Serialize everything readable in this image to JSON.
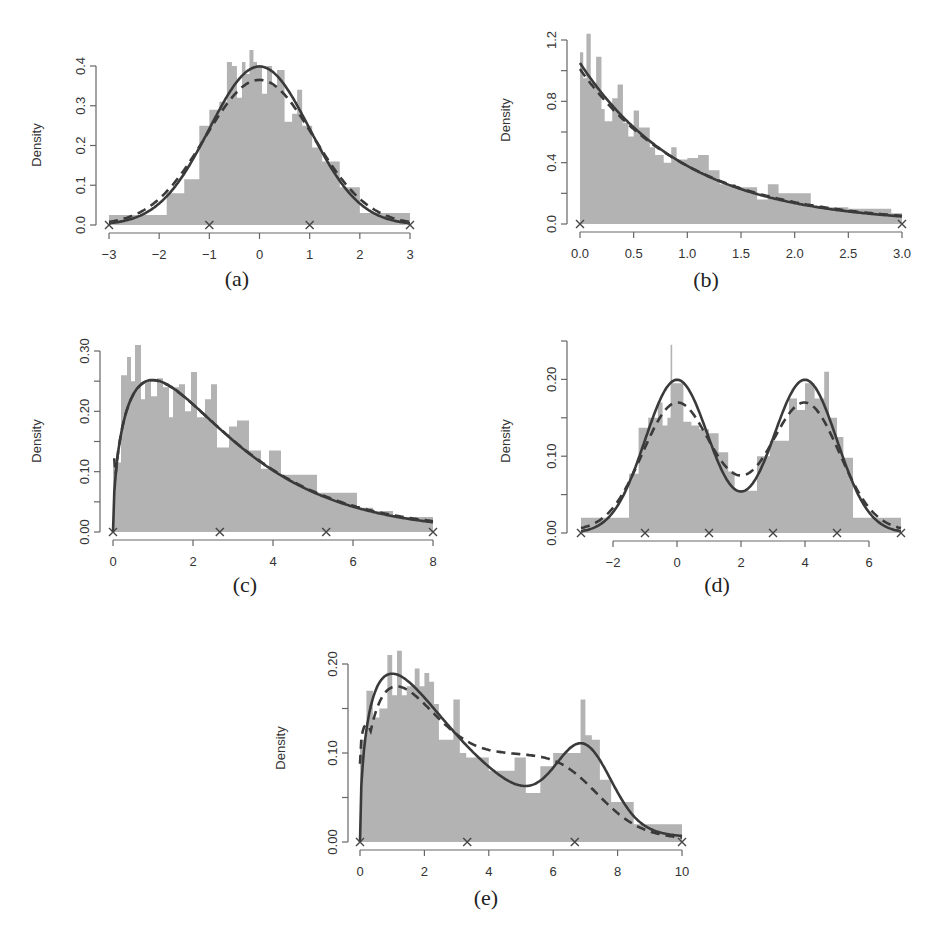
{
  "figure": {
    "panels": [
      "a",
      "b",
      "c",
      "d",
      "e"
    ]
  },
  "chart_data": [
    {
      "id": "a",
      "type": "bar",
      "caption": "(a)",
      "ylabel": "Density",
      "xlabel": "",
      "xlim": [
        -3,
        3
      ],
      "ylim": [
        0,
        0.4
      ],
      "xticks": [
        -3,
        -2,
        -1,
        0,
        1,
        2,
        3
      ],
      "xtick_labels": [
        "−3",
        "−2",
        "−1",
        "0",
        "1",
        "2",
        "3"
      ],
      "yticks": [
        0.0,
        0.1,
        0.2,
        0.3,
        0.4
      ],
      "ytick_labels": [
        "0.0",
        "0.1",
        "0.2",
        "0.3",
        "0.4"
      ],
      "true_density": {
        "family": "normal",
        "mean": 0,
        "sd": 1,
        "peak": 0.4
      },
      "estimated_density": {
        "description": "dashed, slightly flatter normal-like",
        "peak": 0.365
      },
      "knot_markers": [
        -3,
        -1,
        1,
        3
      ],
      "histogram": {
        "edges": [
          -3,
          -2.2,
          -1.85,
          -1.5,
          -1.2,
          -1.0,
          -0.8,
          -0.65,
          -0.55,
          -0.45,
          -0.35,
          -0.28,
          -0.2,
          -0.12,
          -0.05,
          0.05,
          0.15,
          0.25,
          0.35,
          0.5,
          0.65,
          0.75,
          0.85,
          1.05,
          1.25,
          1.6,
          2.0,
          3.0
        ],
        "heights": [
          0.025,
          0.025,
          0.08,
          0.115,
          0.25,
          0.29,
          0.31,
          0.41,
          0.4,
          0.32,
          0.41,
          0.38,
          0.44,
          0.41,
          0.4,
          0.33,
          0.4,
          0.35,
          0.39,
          0.26,
          0.28,
          0.34,
          0.25,
          0.195,
          0.16,
          0.095,
          0.03
        ]
      },
      "box": {
        "x0": 109,
        "x1": 410,
        "y0": 225,
        "ytop": 66,
        "yaxis_x": 96,
        "xaxis_y": 233,
        "xaxis_from": -3,
        "xaxis_to": 3
      }
    },
    {
      "id": "b",
      "type": "bar",
      "caption": "(b)",
      "ylabel": "Density",
      "xlabel": "",
      "xlim": [
        0,
        3
      ],
      "ylim": [
        0,
        1.2
      ],
      "xticks": [
        0.0,
        0.5,
        1.0,
        1.5,
        2.0,
        2.5,
        3.0
      ],
      "xtick_labels": [
        "0.0",
        "0.5",
        "1.0",
        "1.5",
        "2.0",
        "2.5",
        "3.0"
      ],
      "yticks": [
        0.0,
        0.2,
        0.4,
        0.6,
        0.8,
        1.0,
        1.2
      ],
      "ytick_labels": [
        "0.0",
        "",
        "0.4",
        "",
        "0.8",
        "",
        "1.2"
      ],
      "true_density": {
        "family": "exponential",
        "rate": 1,
        "scaled_peak": 1.05
      },
      "estimated_density": {
        "description": "dashed, nearly identical exponential",
        "peak": 1.01
      },
      "knot_markers": [
        0,
        3
      ],
      "histogram": {
        "edges": [
          0,
          0.03,
          0.06,
          0.1,
          0.15,
          0.2,
          0.23,
          0.3,
          0.35,
          0.4,
          0.45,
          0.5,
          0.55,
          0.6,
          0.65,
          0.7,
          0.78,
          0.85,
          0.9,
          1.0,
          1.1,
          1.2,
          1.3,
          1.45,
          1.65,
          1.75,
          1.85,
          1.95,
          2.15,
          2.5,
          2.9,
          3.0
        ],
        "heights": [
          1.12,
          0.95,
          1.24,
          0.92,
          1.09,
          0.75,
          0.67,
          0.82,
          0.91,
          0.66,
          0.57,
          0.74,
          0.63,
          0.63,
          0.5,
          0.45,
          0.4,
          0.5,
          0.42,
          0.43,
          0.45,
          0.35,
          0.26,
          0.24,
          0.16,
          0.26,
          0.2,
          0.2,
          0.11,
          0.1,
          0.07
        ]
      },
      "box": {
        "x0": 580,
        "x1": 902,
        "y0": 224,
        "ytop": 40,
        "yaxis_x": 567,
        "xaxis_y": 232,
        "xaxis_from": 0,
        "xaxis_to": 3
      }
    },
    {
      "id": "c",
      "type": "bar",
      "caption": "(c)",
      "ylabel": "Density",
      "xlabel": "",
      "xlim": [
        0,
        8
      ],
      "ylim": [
        0,
        0.3
      ],
      "xticks": [
        0,
        2,
        4,
        6,
        8
      ],
      "xtick_labels": [
        "0",
        "2",
        "4",
        "6",
        "8"
      ],
      "yticks": [
        0.0,
        0.05,
        0.1,
        0.15,
        0.2,
        0.25,
        0.3
      ],
      "ytick_labels": [
        "0.00",
        "",
        "0.10",
        "",
        "0.20",
        "",
        "0.30"
      ],
      "true_density": {
        "family": "chi-square/gamma-like right-skewed",
        "mode": 1.0,
        "peak": 0.25
      },
      "estimated_density": {
        "description": "dashed, closely following true density",
        "peak": 0.25
      },
      "knot_markers": [
        0,
        2.67,
        5.33,
        8
      ],
      "histogram": {
        "edges": [
          0,
          0.2,
          0.35,
          0.45,
          0.55,
          0.7,
          0.8,
          0.95,
          1.1,
          1.25,
          1.4,
          1.5,
          1.65,
          1.8,
          1.95,
          2.1,
          2.3,
          2.45,
          2.6,
          2.9,
          3.1,
          3.4,
          3.7,
          3.9,
          4.2,
          4.7,
          5.1,
          5.6,
          6.1,
          6.5,
          7.0,
          7.8,
          8.0
        ],
        "heights": [
          0.115,
          0.26,
          0.29,
          0.25,
          0.31,
          0.22,
          0.25,
          0.225,
          0.255,
          0.24,
          0.19,
          0.24,
          0.245,
          0.2,
          0.265,
          0.19,
          0.22,
          0.245,
          0.14,
          0.175,
          0.185,
          0.135,
          0.105,
          0.135,
          0.095,
          0.095,
          0.065,
          0.065,
          0.04,
          0.035,
          0.025,
          0.025
        ]
      },
      "box": {
        "x0": 113,
        "x1": 433,
        "y0": 532,
        "ytop": 351,
        "yaxis_x": 100,
        "xaxis_y": 540,
        "xaxis_from": 0,
        "xaxis_to": 8
      }
    },
    {
      "id": "d",
      "type": "bar",
      "caption": "(d)",
      "ylabel": "Density",
      "xlabel": "",
      "xlim": [
        -3,
        7
      ],
      "ylim": [
        0,
        0.25
      ],
      "xticks": [
        -2,
        0,
        2,
        4,
        6
      ],
      "xtick_labels": [
        "−2",
        "0",
        "2",
        "4",
        "6"
      ],
      "yticks": [
        0.0,
        0.05,
        0.1,
        0.15,
        0.2,
        0.25
      ],
      "ytick_labels": [
        "0.00",
        "",
        "0.10",
        "",
        "0.20",
        ""
      ],
      "true_density": {
        "family": "bimodal normal mixture",
        "components": [
          {
            "mean": 0,
            "sd": 1,
            "weight": 0.5
          },
          {
            "mean": 4,
            "sd": 1,
            "weight": 0.5
          }
        ],
        "peak": 0.2
      },
      "estimated_density": {
        "description": "dashed, slightly lower peaks (~0.18), higher trough (~0.07)"
      },
      "knot_markers": [
        -3,
        -1,
        1,
        3,
        5,
        7
      ],
      "histogram": {
        "edges": [
          -3,
          -1.5,
          -1.2,
          -0.9,
          -0.6,
          -0.45,
          -0.3,
          -0.2,
          -0.15,
          0.2,
          0.45,
          0.7,
          1.0,
          1.3,
          1.6,
          1.8,
          2.2,
          2.5,
          2.9,
          3.2,
          3.5,
          3.75,
          4.0,
          4.3,
          4.6,
          4.75,
          5.0,
          5.2,
          5.5,
          7.0
        ],
        "heights": [
          0.02,
          0.077,
          0.137,
          0.15,
          0.17,
          0.14,
          0.15,
          0.245,
          0.195,
          0.145,
          0.14,
          0.135,
          0.13,
          0.105,
          0.08,
          0.055,
          0.055,
          0.1,
          0.12,
          0.12,
          0.175,
          0.16,
          0.195,
          0.175,
          0.21,
          0.15,
          0.125,
          0.098,
          0.02
        ]
      },
      "box": {
        "x0": 581,
        "x1": 901,
        "y0": 533,
        "ytop": 341,
        "yaxis_x": 567,
        "xaxis_y": 541,
        "xaxis_from": -2,
        "xaxis_to": 6
      }
    },
    {
      "id": "e",
      "type": "bar",
      "caption": "(e)",
      "ylabel": "Density",
      "xlabel": "",
      "xlim": [
        0,
        10
      ],
      "ylim": [
        0,
        0.2
      ],
      "xticks": [
        0,
        2,
        4,
        6,
        8,
        10
      ],
      "xtick_labels": [
        "0",
        "2",
        "4",
        "6",
        "8",
        "10"
      ],
      "yticks": [
        0.0,
        0.05,
        0.1,
        0.15,
        0.2
      ],
      "ytick_labels": [
        "0.00",
        "",
        "0.10",
        "",
        "0.20"
      ],
      "true_density": {
        "family": "mixture of right-skewed and normal",
        "modes": [
          1.0,
          6.9
        ],
        "peaks": [
          0.197,
          0.106
        ],
        "trough": {
          "x": 5.1,
          "y": 0.07
        }
      },
      "estimated_density": {
        "description": "dashed, smoother second mode (~0.10 near 6.5), trough ~0.083"
      },
      "knot_markers": [
        0,
        3.33,
        6.67,
        10
      ],
      "histogram": {
        "edges": [
          0,
          0.2,
          0.4,
          0.6,
          0.85,
          1.0,
          1.15,
          1.3,
          1.45,
          1.7,
          1.85,
          2.0,
          2.15,
          2.3,
          2.45,
          2.7,
          2.9,
          3.1,
          3.3,
          4.0,
          4.8,
          5.15,
          5.6,
          6.0,
          6.4,
          6.85,
          7.0,
          7.2,
          7.45,
          7.8,
          8.5,
          10.0
        ],
        "heights": [
          0.115,
          0.17,
          0.14,
          0.15,
          0.21,
          0.165,
          0.215,
          0.165,
          0.175,
          0.195,
          0.175,
          0.19,
          0.18,
          0.155,
          0.115,
          0.115,
          0.16,
          0.1,
          0.095,
          0.08,
          0.095,
          0.055,
          0.085,
          0.1,
          0.1,
          0.16,
          0.12,
          0.115,
          0.07,
          0.045,
          0.02
        ]
      },
      "box": {
        "x0": 360,
        "x1": 682,
        "y0": 842,
        "ytop": 664,
        "yaxis_x": 348,
        "xaxis_y": 850,
        "xaxis_from": 0,
        "xaxis_to": 10
      }
    }
  ]
}
